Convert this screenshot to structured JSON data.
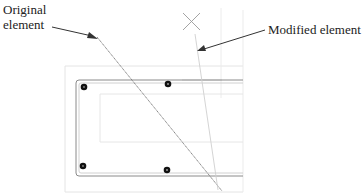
{
  "diagram": {
    "labels": {
      "original_line1": "Original",
      "original_line2": "element",
      "modified": "Modified element"
    },
    "colors": {
      "text": "#222222",
      "arrow": "#333333",
      "main_outline": "#8a8a8a",
      "faint_outline": "#e2e2e2",
      "original_line": "#6e6e6e",
      "modified_line": "#cfcfcf",
      "rebar_dot": "#111111"
    },
    "rebar_dots": [
      {
        "x": 84,
        "y": 87
      },
      {
        "x": 168,
        "y": 84
      },
      {
        "x": 83,
        "y": 166
      },
      {
        "x": 167,
        "y": 170
      }
    ]
  }
}
